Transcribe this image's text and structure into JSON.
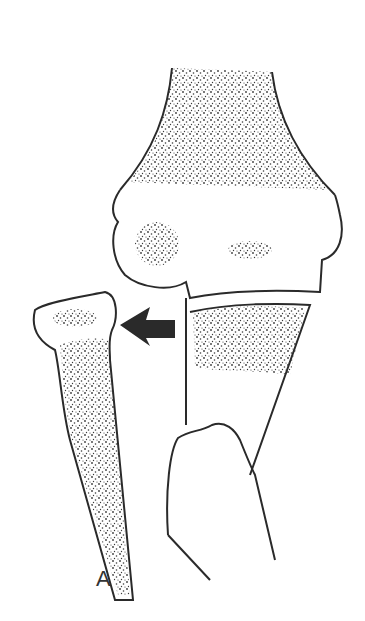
{
  "figure": {
    "panel_label": "A",
    "colors": {
      "line": "#2a2a2a",
      "stipple": "#3a3a3a",
      "background": "#ffffff",
      "arrow": "#2a2a2a"
    },
    "arrow": {
      "direction": "left"
    }
  }
}
